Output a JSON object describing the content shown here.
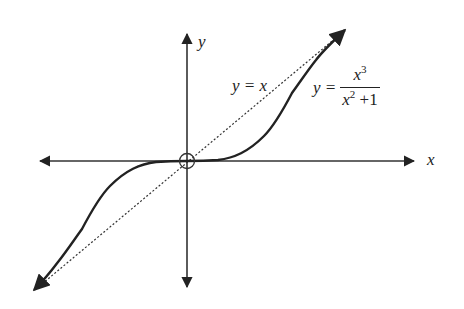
{
  "diagram": {
    "axes": {
      "x_label": "x",
      "y_label": "y",
      "origin_marker": "open-circle-with-crosshair"
    },
    "labels": {
      "line": "y = x",
      "curve_lhs": "y =",
      "curve_num": "x",
      "curve_num_exp": "3",
      "curve_den": "x",
      "curve_den_exp": "2",
      "curve_den_tail": " +1"
    },
    "colors": {
      "ink": "#222222",
      "background": "#ffffff"
    }
  }
}
